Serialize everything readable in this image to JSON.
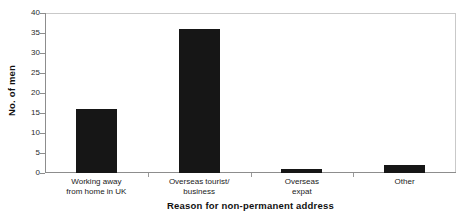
{
  "chart_data": {
    "type": "bar",
    "title": "",
    "categories": [
      "Working away from home in UK",
      "Overseas tourist/business",
      "Overseas expat",
      "Other"
    ],
    "category_lines": [
      [
        "Working away",
        "from home in UK"
      ],
      [
        "Overseas tourist/",
        "business"
      ],
      [
        "Overseas",
        "expat"
      ],
      [
        "Other"
      ]
    ],
    "values": [
      16,
      36,
      1,
      2
    ],
    "xlabel": "Reason for non-permanent address",
    "ylabel": "No. of men",
    "ylim": [
      0,
      40
    ],
    "ytick_labels": [
      "40",
      "35",
      "30",
      "25",
      "20",
      "15",
      "10",
      "5",
      "0"
    ],
    "ytick_values": [
      40,
      35,
      30,
      25,
      20,
      15,
      10,
      5,
      0
    ],
    "grid": false,
    "legend": "none",
    "bar_color": "#161616",
    "frame_color": "#c9c9c9",
    "axis_color": "#8d8d8d"
  }
}
